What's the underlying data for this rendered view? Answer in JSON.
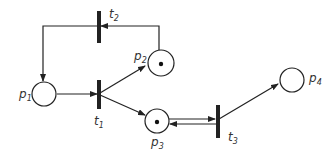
{
  "diagram": {
    "type": "petri-net",
    "colors": {
      "stroke": "#222222",
      "bar": "#222222",
      "token": "#111111",
      "text": "#333333"
    },
    "places": [
      {
        "id": "p1",
        "label": "p",
        "sub": "1",
        "tokens": 0
      },
      {
        "id": "p2",
        "label": "p",
        "sub": "2",
        "tokens": 1
      },
      {
        "id": "p3",
        "label": "p",
        "sub": "3",
        "tokens": 1
      },
      {
        "id": "p4",
        "label": "p",
        "sub": "4",
        "tokens": 0
      }
    ],
    "transitions": [
      {
        "id": "t1",
        "label": "t",
        "sub": "1"
      },
      {
        "id": "t2",
        "label": "t",
        "sub": "2"
      },
      {
        "id": "t3",
        "label": "t",
        "sub": "3"
      }
    ],
    "arcs": [
      {
        "from": "p1",
        "to": "t1"
      },
      {
        "from": "t1",
        "to": "p2"
      },
      {
        "from": "t1",
        "to": "p3"
      },
      {
        "from": "p2",
        "to": "t2"
      },
      {
        "from": "t2",
        "to": "p1"
      },
      {
        "from": "p3",
        "to": "t3"
      },
      {
        "from": "t3",
        "to": "p3"
      },
      {
        "from": "t3",
        "to": "p4"
      }
    ]
  }
}
